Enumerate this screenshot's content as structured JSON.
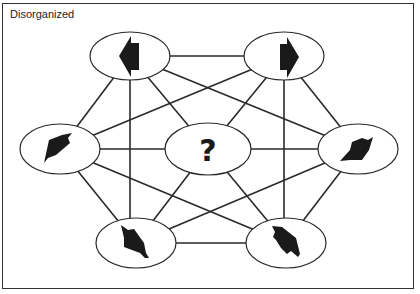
{
  "diagram": {
    "title": "Disorganized",
    "center_label": "?",
    "colors": {
      "line": "#2a2a2a",
      "shape": "#1a1a1a",
      "node_fill": "#ffffff",
      "border": "#333333"
    },
    "nodes": [
      {
        "id": "top-left",
        "cx": 130,
        "cy": 56,
        "icon": "arrow-left-icon"
      },
      {
        "id": "top-right",
        "cx": 284,
        "cy": 56,
        "icon": "arrow-right-icon"
      },
      {
        "id": "left",
        "cx": 60,
        "cy": 149,
        "icon": "arrow-up-right-icon"
      },
      {
        "id": "center",
        "cx": 208,
        "cy": 149,
        "icon": "question-mark-icon"
      },
      {
        "id": "right",
        "cx": 358,
        "cy": 149,
        "icon": "arrow-down-left-icon"
      },
      {
        "id": "bottom-left",
        "cx": 136,
        "cy": 243,
        "icon": "arrow-down-right-icon"
      },
      {
        "id": "bottom-right",
        "cx": 286,
        "cy": 243,
        "icon": "arrow-down-right-icon"
      }
    ],
    "edges": [
      [
        "top-left",
        "top-right"
      ],
      [
        "top-left",
        "left"
      ],
      [
        "top-left",
        "bottom-left"
      ],
      [
        "top-left",
        "center"
      ],
      [
        "top-left",
        "right"
      ],
      [
        "top-right",
        "right"
      ],
      [
        "top-right",
        "bottom-right"
      ],
      [
        "top-right",
        "center"
      ],
      [
        "top-right",
        "left"
      ],
      [
        "left",
        "center"
      ],
      [
        "left",
        "bottom-left"
      ],
      [
        "left",
        "bottom-right"
      ],
      [
        "right",
        "center"
      ],
      [
        "right",
        "bottom-right"
      ],
      [
        "right",
        "bottom-left"
      ],
      [
        "center",
        "bottom-left"
      ],
      [
        "center",
        "bottom-right"
      ],
      [
        "bottom-left",
        "bottom-right"
      ]
    ]
  }
}
